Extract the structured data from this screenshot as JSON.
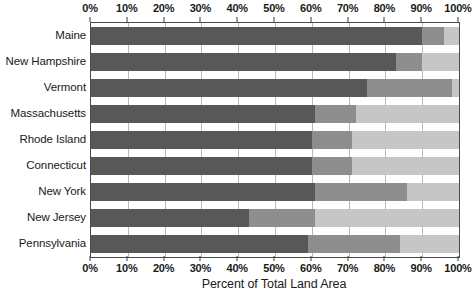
{
  "chart_data": {
    "type": "bar",
    "orientation": "horizontal",
    "stacked": true,
    "normalized_percent": true,
    "title": "",
    "xlabel": "Percent of Total Land Area",
    "ylabel": "",
    "xlim": [
      0,
      100
    ],
    "xticks": [
      0,
      10,
      20,
      30,
      40,
      50,
      60,
      70,
      80,
      90,
      100
    ],
    "xticklabels": [
      "0%",
      "10%",
      "20%",
      "30%",
      "40%",
      "50%",
      "60%",
      "70%",
      "80%",
      "90%",
      "100%"
    ],
    "grid": "vertical",
    "legend": "none",
    "axis_labels_position": "top-and-bottom",
    "categories": [
      "Maine",
      "New Hampshire",
      "Vermont",
      "Massachusetts",
      "Rhode Island",
      "Connecticut",
      "New York",
      "New Jersey",
      "Pennsylvania"
    ],
    "series": [
      {
        "name": "segment-1",
        "color": "#585858",
        "values": [
          90,
          83,
          75,
          61,
          60,
          60,
          61,
          43,
          59
        ]
      },
      {
        "name": "segment-2",
        "color": "#8e8e8e",
        "values": [
          6,
          7,
          23,
          11,
          11,
          11,
          25,
          18,
          25
        ]
      },
      {
        "name": "segment-3",
        "color": "#c6c6c6",
        "values": [
          4,
          10,
          2,
          28,
          29,
          29,
          14,
          39,
          16
        ]
      }
    ],
    "colors": {
      "dark": "#585858",
      "medium": "#8e8e8e",
      "light": "#c6c6c6",
      "axis": "#4a4a4a",
      "gridline": "#b9b9b9",
      "text": "#1a1a1a"
    }
  }
}
